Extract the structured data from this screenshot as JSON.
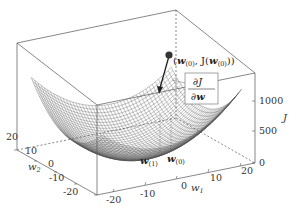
{
  "chart_data": {
    "type": "surface3d",
    "title": "",
    "xlabel": "w_1",
    "ylabel": "w_2",
    "zlabel": "J",
    "x_ticks": [
      "-20",
      "-10",
      "0",
      "10",
      "20"
    ],
    "y_ticks": [
      "20",
      "10",
      "0",
      "-10",
      "-20"
    ],
    "z_ticks": [
      "0",
      "500",
      "1000"
    ],
    "xlim": [
      -25,
      25
    ],
    "ylim": [
      -25,
      25
    ],
    "zlim": [
      0,
      1400
    ],
    "surface": "paraboloid (wireframe mesh)",
    "grid": false,
    "annotations": {
      "point_label_w": "w",
      "point_label_sub": "(0)",
      "point_label_mid": ", J(",
      "point_label_end": "))",
      "gradient_num": "∂J",
      "gradient_den": "∂w",
      "proj_w1": "w",
      "proj_w1_sub": "(1)",
      "proj_w0": "w",
      "proj_w0_sub": "(0)",
      "open_paren": "("
    }
  },
  "colors": {
    "mesh": "#555555",
    "box": "#555555",
    "point": "#333333",
    "text": "#333333"
  }
}
